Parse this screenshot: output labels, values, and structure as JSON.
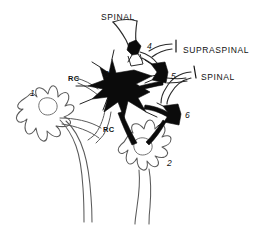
{
  "figure": {
    "type": "neural-circuit-diagram",
    "background_color": "#ffffff",
    "ink_color": "#111111",
    "outline_color": "#5a5a5a",
    "width": 258,
    "height": 233
  },
  "pathway_labels": [
    {
      "id": "spinal-top",
      "text": "SPINAL",
      "x": 101,
      "y": 13
    },
    {
      "id": "supraspinal-right",
      "text": "SUPRASPINAL",
      "x": 183,
      "y": 46
    },
    {
      "id": "spinal-right",
      "text": "SPINAL",
      "x": 201,
      "y": 73
    }
  ],
  "cell_labels": [
    {
      "id": "cell-1",
      "text": "1",
      "x": 30,
      "y": 89
    },
    {
      "id": "cell-2",
      "text": "2",
      "x": 167,
      "y": 159
    },
    {
      "id": "cell-3",
      "text": "3",
      "x": 104,
      "y": 70
    },
    {
      "id": "cell-4",
      "text": "4",
      "x": 147,
      "y": 42
    },
    {
      "id": "cell-5",
      "text": "5",
      "x": 171,
      "y": 72
    },
    {
      "id": "cell-6",
      "text": "6",
      "x": 185,
      "y": 111
    }
  ],
  "rc_labels": [
    {
      "id": "rc-upper",
      "text": "RC",
      "x": 68,
      "y": 75
    },
    {
      "id": "rc-lower",
      "text": "RC",
      "x": 103,
      "y": 126
    }
  ],
  "legend": {
    "bracket_supraspinal": {
      "x": 175,
      "y": 42,
      "height": 11
    },
    "bracket_spinal": {
      "x": 193,
      "y": 68,
      "height": 11
    }
  }
}
